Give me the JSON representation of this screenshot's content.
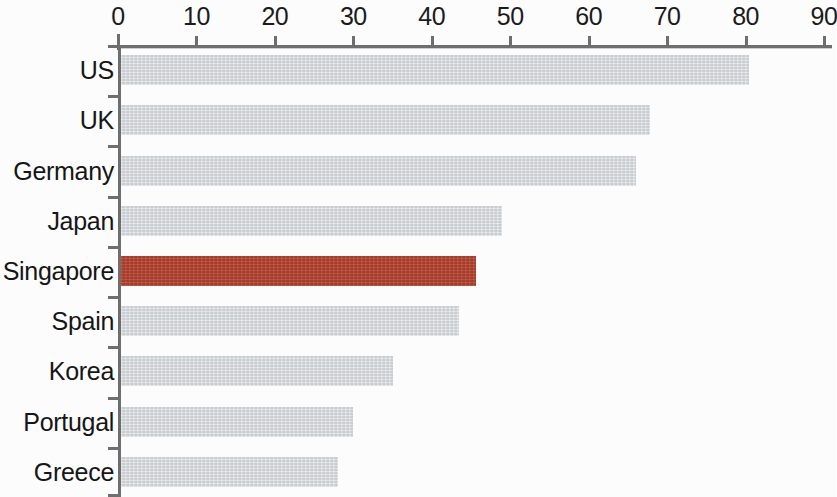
{
  "chart_data": {
    "type": "bar",
    "orientation": "horizontal",
    "title": "",
    "subtitle": "",
    "xlabel": "",
    "ylabel": "",
    "categories": [
      "US",
      "UK",
      "Germany",
      "Japan",
      "Singapore",
      "Spain",
      "Korea",
      "Portugal",
      "Greece"
    ],
    "values": [
      80.5,
      67.8,
      66.0,
      49.0,
      45.7,
      43.5,
      35.0,
      30.0,
      28.0
    ],
    "series": [
      {
        "name": "",
        "values": [
          80.5,
          67.8,
          66.0,
          49.0,
          45.7,
          43.5,
          35.0,
          30.0,
          28.0
        ]
      }
    ],
    "xlim": [
      0,
      90
    ],
    "x_ticks": [
      0,
      10,
      20,
      30,
      40,
      50,
      60,
      70,
      80,
      90
    ],
    "x_tick_labels": [
      "0",
      "10",
      "20",
      "30",
      "40",
      "50",
      "60",
      "70",
      "80",
      "90"
    ],
    "grid": false,
    "legend": false,
    "legend_position": "none",
    "highlight_category": "Singapore",
    "colors": {
      "bar": "#d8dbde",
      "highlight": "#b5432f",
      "axis": "#6f6f6f",
      "text": "#161616",
      "background": "#fdfdfd"
    },
    "bars": [
      {
        "label": "US",
        "value": 80.5,
        "highlighted": false
      },
      {
        "label": "UK",
        "value": 67.8,
        "highlighted": false
      },
      {
        "label": "Germany",
        "value": 66.0,
        "highlighted": false
      },
      {
        "label": "Japan",
        "value": 49.0,
        "highlighted": false
      },
      {
        "label": "Singapore",
        "value": 45.7,
        "highlighted": true
      },
      {
        "label": "Spain",
        "value": 43.5,
        "highlighted": false
      },
      {
        "label": "Korea",
        "value": 35.0,
        "highlighted": false
      },
      {
        "label": "Portugal",
        "value": 30.0,
        "highlighted": false
      },
      {
        "label": "Greece",
        "value": 28.0,
        "highlighted": false
      }
    ]
  }
}
